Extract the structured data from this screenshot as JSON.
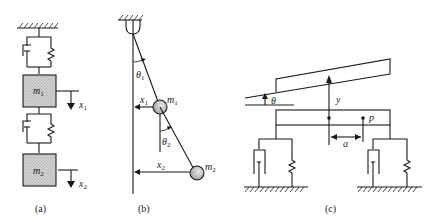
{
  "figure": {
    "panels": [
      {
        "caption": "(a)",
        "description": "Two-mass spring-damper chain hanging from a fixed support",
        "masses": [
          {
            "label": "m",
            "subscript": "1",
            "displacement_label": "x",
            "displacement_subscript": "1"
          },
          {
            "label": "m",
            "subscript": "2",
            "displacement_label": "x",
            "displacement_subscript": "2"
          }
        ]
      },
      {
        "caption": "(b)",
        "description": "Double pendulum",
        "angles": [
          {
            "label": "θ",
            "subscript": "1"
          },
          {
            "label": "θ",
            "subscript": "2"
          }
        ],
        "masses": [
          {
            "label": "m",
            "subscript": "1"
          },
          {
            "label": "m",
            "subscript": "2"
          }
        ],
        "displacements": [
          {
            "label": "x",
            "subscript": "1"
          },
          {
            "label": "x",
            "subscript": "2"
          }
        ]
      },
      {
        "caption": "(c)",
        "description": "Rigid bar on two spring-damper supports with heave and pitch",
        "labels": {
          "angle": "θ",
          "heave": "y",
          "point": "p",
          "offset": "a"
        }
      }
    ],
    "colors": {
      "line": "#1a1a1a",
      "mass_fill": "#c8c8c8",
      "background": "#ffffff"
    }
  }
}
